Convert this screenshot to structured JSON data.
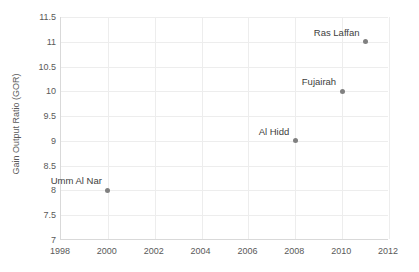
{
  "chart_data": {
    "type": "scatter",
    "title": "",
    "xlabel": "",
    "ylabel": "Gain Output Ratio (GOR)",
    "xlim": [
      1998,
      2012
    ],
    "ylim": [
      7,
      11.5
    ],
    "grid": true,
    "legend": "none",
    "x_ticks": [
      "1998",
      "2000",
      "2002",
      "2004",
      "2006",
      "2008",
      "2010",
      "2012"
    ],
    "x_tick_values": [
      1998,
      2000,
      2002,
      2004,
      2006,
      2008,
      2010,
      2012
    ],
    "y_ticks": [
      "7",
      "7.5",
      "8",
      "8.5",
      "9",
      "9.5",
      "10",
      "10.5",
      "11",
      "11.5"
    ],
    "y_tick_values": [
      7,
      7.5,
      8,
      8.5,
      9,
      9.5,
      10,
      10.5,
      11,
      11.5
    ],
    "marker_color": "#808080",
    "grid_color": "#ededed",
    "axis_color": "#d9d9d9",
    "label_color": "#404040",
    "tick_color": "#595959",
    "points": [
      {
        "label": "Umm Al Nar",
        "x": 2000,
        "y": 8
      },
      {
        "label": "Al Hidd",
        "x": 2008,
        "y": 9
      },
      {
        "label": "Fujairah",
        "x": 2010,
        "y": 10
      },
      {
        "label": "Ras Laffan",
        "x": 2011,
        "y": 11
      }
    ]
  }
}
